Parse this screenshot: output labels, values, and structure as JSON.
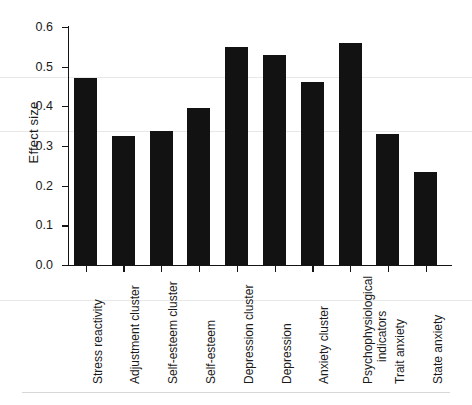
{
  "chart_data": {
    "type": "bar",
    "title": "",
    "subtitle": "",
    "xlabel": "",
    "ylabel": "Effect size",
    "ylim": [
      0.0,
      0.62
    ],
    "yticks": [
      "0.0",
      "0.1",
      "0.2",
      "0.3",
      "0.4",
      "0.5",
      "0.6"
    ],
    "ytick_values": [
      0.0,
      0.1,
      0.2,
      0.3,
      0.4,
      0.5,
      0.6
    ],
    "grid": false,
    "legend": null,
    "bar_color": "#121212",
    "axis_color": "#141414",
    "categories": [
      "Stress reactivity",
      "Adjustment cluster",
      "Self-esteem cluster",
      "Self-esteem",
      "Depression cluster",
      "Depression",
      "Anxiety cluster",
      "Psychophysiological indicators",
      "Trait anxiety",
      "State anxiety"
    ],
    "category_lines": [
      [
        "Stress reactivity"
      ],
      [
        "Adjustment cluster"
      ],
      [
        "Self-esteem cluster"
      ],
      [
        "Self-esteem"
      ],
      [
        "Depression cluster"
      ],
      [
        "Depression"
      ],
      [
        "Anxiety cluster"
      ],
      [
        "Psychophysiological",
        "indicators"
      ],
      [
        "Trait anxiety"
      ],
      [
        "State anxiety"
      ]
    ],
    "values": [
      0.47,
      0.325,
      0.337,
      0.395,
      0.549,
      0.529,
      0.461,
      0.559,
      0.33,
      0.235
    ]
  }
}
